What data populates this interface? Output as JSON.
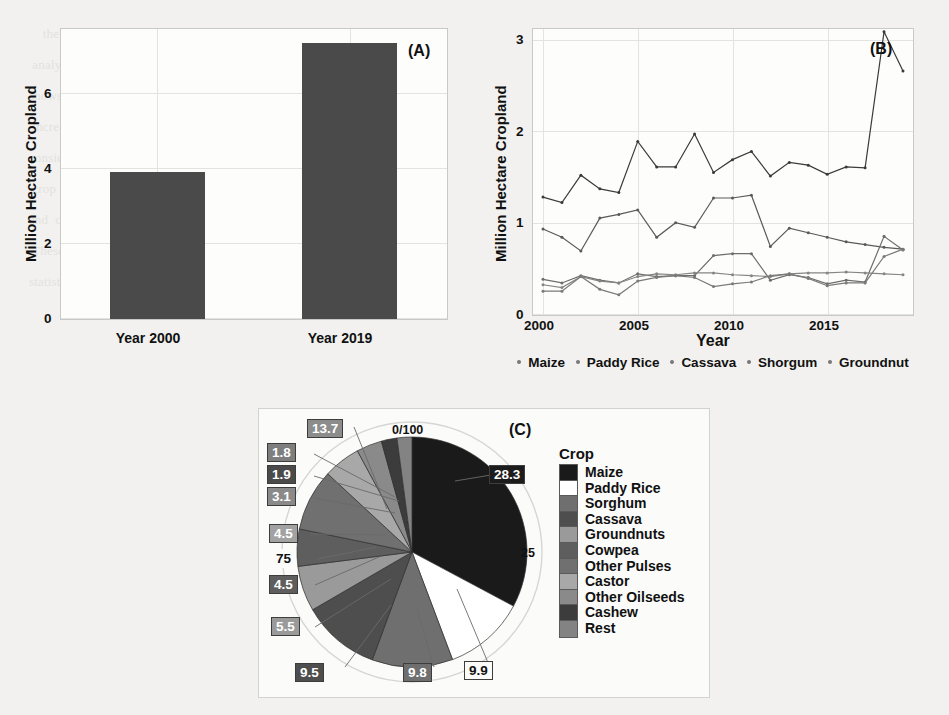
{
  "figure": {
    "background_color": "#f2f1ef",
    "ink_color": "#4a4a4a"
  },
  "panelA": {
    "tag": "(A)",
    "ylabel": "Million Hectare Cropland",
    "chart_data": {
      "type": "bar",
      "title": "",
      "xlabel": "",
      "ylabel": "Million Hectare Cropland",
      "categories": [
        "Year 2000",
        "Year 2019"
      ],
      "values": [
        3.9,
        7.35
      ],
      "ylim": [
        0,
        7.7
      ],
      "yticks": [
        "0",
        "2",
        "4",
        "6"
      ],
      "ytick_values": [
        0,
        2,
        4,
        6
      ],
      "grid": true,
      "legend": "none",
      "bar_color": "#4a4a4a"
    }
  },
  "panelB": {
    "tag": "(B)",
    "ylabel": "Million Hectare Cropland",
    "xlabel": "Year",
    "legend_items": [
      "Maize",
      "Paddy Rice",
      "Cassava",
      "Shorgum",
      "Groundnut"
    ],
    "chart_data": {
      "type": "line",
      "title": "",
      "xlabel": "Year",
      "ylabel": "Million Hectare Cropland",
      "x": [
        2000,
        2001,
        2002,
        2003,
        2004,
        2005,
        2006,
        2007,
        2008,
        2009,
        2010,
        2011,
        2012,
        2013,
        2014,
        2015,
        2016,
        2017,
        2018,
        2019
      ],
      "xlim": [
        2000,
        2019
      ],
      "ylim": [
        0,
        3.15
      ],
      "xticks": [
        "2000",
        "2005",
        "2010",
        "2015"
      ],
      "xtick_values": [
        2000,
        2005,
        2010,
        2015
      ],
      "yticks": [
        "0",
        "1",
        "2",
        "3"
      ],
      "ytick_values": [
        0,
        1,
        2,
        3
      ],
      "grid": true,
      "legend_position": "bottom",
      "series": [
        {
          "name": "Maize",
          "color": "#3a3a3a",
          "values": [
            1.28,
            1.22,
            1.52,
            1.37,
            1.33,
            1.89,
            1.61,
            1.61,
            1.97,
            1.55,
            1.69,
            1.78,
            1.51,
            1.66,
            1.63,
            1.53,
            1.61,
            1.6,
            3.09,
            2.66
          ]
        },
        {
          "name": "Paddy Rice",
          "color": "#5a5a5a",
          "values": [
            0.93,
            0.84,
            0.69,
            1.05,
            1.09,
            1.14,
            0.84,
            1.0,
            0.95,
            1.27,
            1.27,
            1.3,
            0.74,
            0.94,
            0.89,
            0.84,
            0.79,
            0.76,
            0.73,
            0.71
          ]
        },
        {
          "name": "Cassava",
          "color": "#6d6d6d",
          "values": [
            0.38,
            0.34,
            0.42,
            0.37,
            0.34,
            0.44,
            0.41,
            0.42,
            0.42,
            0.64,
            0.66,
            0.66,
            0.37,
            0.43,
            0.4,
            0.33,
            0.37,
            0.35,
            0.85,
            0.7
          ]
        },
        {
          "name": "Shorgum",
          "color": "#858585",
          "values": [
            0.32,
            0.29,
            0.41,
            0.36,
            0.34,
            0.41,
            0.44,
            0.43,
            0.45,
            0.45,
            0.43,
            0.42,
            0.41,
            0.44,
            0.45,
            0.45,
            0.46,
            0.45,
            0.44,
            0.43
          ]
        },
        {
          "name": "Groundnut",
          "color": "#7a7a7a",
          "values": [
            0.25,
            0.25,
            0.41,
            0.27,
            0.21,
            0.36,
            0.4,
            0.42,
            0.4,
            0.3,
            0.33,
            0.35,
            0.42,
            0.44,
            0.39,
            0.31,
            0.34,
            0.34,
            0.63,
            0.71
          ]
        }
      ]
    }
  },
  "panelC": {
    "tag": "(C)",
    "legend_title": "Crop",
    "ring_ticks": [
      "0/100",
      "25",
      "75"
    ],
    "chart_data": {
      "type": "pie",
      "title": "",
      "legend_title": "Crop",
      "legend_position": "right",
      "units": "percent",
      "labels": [
        "Maize",
        "Paddy Rice",
        "Sorghum",
        "Cassava",
        "Groundnuts",
        "Cowpea",
        "Other Pulses",
        "Castor",
        "Other Oilseeds",
        "Cashew",
        "Rest"
      ],
      "values": [
        28.3,
        9.9,
        9.8,
        9.5,
        5.5,
        4.5,
        7.5,
        4.5,
        3.1,
        1.9,
        1.8
      ],
      "value_labels": [
        "28.3",
        "9.9",
        "9.8",
        "9.5",
        "5.5",
        "4.5",
        "75",
        "4.5",
        "3.1",
        "1.9",
        "1.8"
      ],
      "rest_label": "13.7",
      "colors": [
        "#1a1a1a",
        "#ffffff",
        "#6f6f6f",
        "#4e4e4e",
        "#9a9a9a",
        "#5e5e5e",
        "#707070",
        "#a8a8a8",
        "#8a8a8a",
        "#3c3c3c",
        "#838383"
      ],
      "slice_order_note": "clockwise from 12 o'clock"
    },
    "legend_rows": [
      {
        "label": "Maize",
        "color": "#1a1a1a"
      },
      {
        "label": "Paddy Rice",
        "color": "#ffffff"
      },
      {
        "label": "Sorghum",
        "color": "#6f6f6f"
      },
      {
        "label": "Cassava",
        "color": "#4e4e4e"
      },
      {
        "label": "Groundnuts",
        "color": "#9a9a9a"
      },
      {
        "label": "Cowpea",
        "color": "#5e5e5e"
      },
      {
        "label": "Other Pulses",
        "color": "#707070"
      },
      {
        "label": "Castor",
        "color": "#a8a8a8"
      },
      {
        "label": "Other Oilseeds",
        "color": "#8a8a8a"
      },
      {
        "label": "Cashew",
        "color": "#3c3c3c"
      },
      {
        "label": "Rest",
        "color": "#838383"
      }
    ],
    "callouts": [
      {
        "text": "13.7",
        "dark": true
      },
      {
        "text": "1.8",
        "dark": true
      },
      {
        "text": "1.9",
        "dark": true
      },
      {
        "text": "3.1",
        "dark": true
      },
      {
        "text": "4.5",
        "dark": true
      },
      {
        "text": "75",
        "dark": false
      },
      {
        "text": "4.5",
        "dark": true
      },
      {
        "text": "5.5",
        "dark": true
      },
      {
        "text": "9.5",
        "dark": true
      },
      {
        "text": "9.8",
        "dark": true
      },
      {
        "text": "9.9",
        "dark": false
      },
      {
        "text": "28.3",
        "dark": true
      }
    ]
  },
  "ghost_text": "      the  research  and  the  data  collected  for  the\n   analysis  of  cropland  expansion  across  regions\n  shows  that  the  total  area  under  cultivation  has\n   increased  substantially  over  the  two  decades\n  considered  here.  Maize  remains  the  dominant\n   crop  by  harvested  area,  followed  by  paddy  rice\n  and  cassava  in  most  of  the  surveyed  districts.\n   These  patterns  are  consistent  with  the  national\n  statistics  reported  by  the  ministry  of  agriculture."
}
